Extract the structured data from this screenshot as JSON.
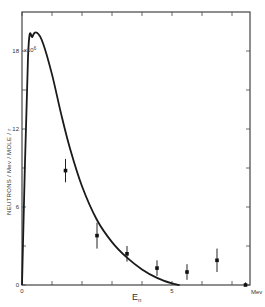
{
  "chart_data": {
    "type": "line",
    "title": "",
    "xlabel": "E_n",
    "xunit": "Mev",
    "ylabel": "NEUTRONS / Mev / MOLE / r",
    "y_multiplier_label": "x10^6",
    "xlim": [
      0,
      7.6
    ],
    "ylim": [
      0,
      21
    ],
    "x_ticks": [
      0,
      1,
      2,
      3,
      4,
      5,
      6,
      7
    ],
    "x_tick_labels": {
      "0": "0",
      "5": "5"
    },
    "y_ticks": [
      0,
      3,
      6,
      9,
      12,
      15,
      18
    ],
    "y_tick_labels": {
      "0": "0",
      "6": "6",
      "12": "12",
      "18": "18"
    },
    "grid": false,
    "legend": null,
    "series": [
      {
        "name": "theoretical curve",
        "kind": "line",
        "x": [
          0,
          0.2,
          0.35,
          0.5,
          0.7,
          1.0,
          1.3,
          1.6,
          2.0,
          2.5,
          3.0,
          3.5,
          4.0,
          4.5,
          5.0,
          5.25
        ],
        "y": [
          0,
          17.5,
          19.1,
          19.4,
          18.6,
          16.2,
          13.2,
          10.5,
          7.6,
          5.0,
          3.3,
          2.1,
          1.2,
          0.55,
          0.12,
          0
        ]
      },
      {
        "name": "measured points",
        "kind": "scatter_errorbars",
        "x": [
          1.45,
          2.5,
          3.5,
          4.5,
          5.5,
          6.5,
          7.45
        ],
        "y": [
          8.8,
          3.8,
          2.4,
          1.3,
          1.0,
          1.9,
          0.0
        ],
        "yerr": [
          0.9,
          1.0,
          0.6,
          0.6,
          0.6,
          0.9,
          0.2
        ]
      }
    ]
  }
}
